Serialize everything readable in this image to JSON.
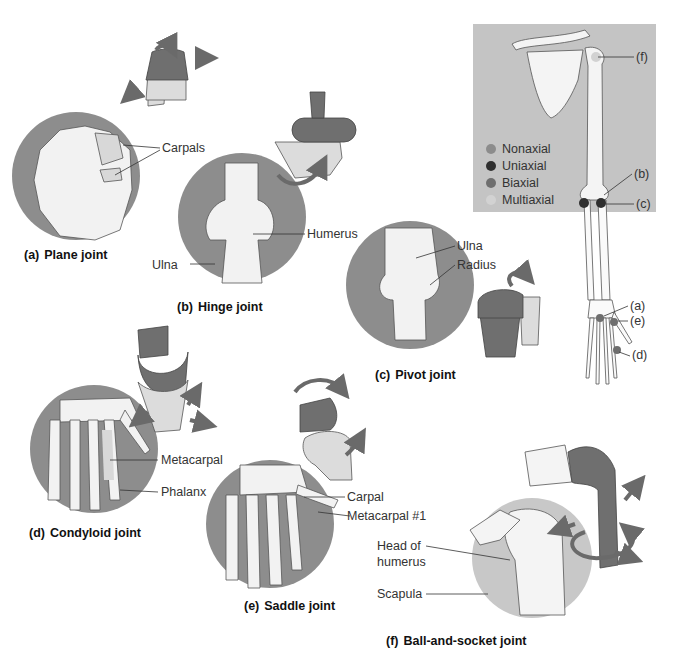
{
  "figure": {
    "panels": [
      {
        "id": "a",
        "prefix": "(a)",
        "title": "Plane joint",
        "labels": [
          "Carpals"
        ]
      },
      {
        "id": "b",
        "prefix": "(b)",
        "title": "Hinge joint",
        "labels": [
          "Humerus",
          "Ulna"
        ]
      },
      {
        "id": "c",
        "prefix": "(c)",
        "title": "Pivot joint",
        "labels": [
          "Ulna",
          "Radius"
        ]
      },
      {
        "id": "d",
        "prefix": "(d)",
        "title": "Condyloid joint",
        "labels": [
          "Metacarpal",
          "Phalanx"
        ]
      },
      {
        "id": "e",
        "prefix": "(e)",
        "title": "Saddle joint",
        "labels": [
          "Carpal",
          "Metacarpal #1"
        ]
      },
      {
        "id": "f",
        "prefix": "(f)",
        "title": "Ball-and-socket joint",
        "labels": [
          "Head of",
          "humerus",
          "Scapula"
        ]
      }
    ],
    "skeleton_inset": {
      "markers": [
        "(f)",
        "(b)",
        "(c)",
        "(a)",
        "(e)",
        "(d)"
      ],
      "legend": [
        {
          "label": "Nonaxial",
          "color": "#8c8c8c"
        },
        {
          "label": "Uniaxial",
          "color": "#2f2f2f"
        },
        {
          "label": "Biaxial",
          "color": "#6e6e6e"
        },
        {
          "label": "Multiaxial",
          "color": "#d2d2d2"
        }
      ],
      "background": "#c4c4c4"
    },
    "colors": {
      "circle_bg": "#8d8d8d",
      "circle_bg_light": "#c8c8c8",
      "bone": "#f2f2f2",
      "model_dark": "#6f6f6f",
      "model_light": "#dcdcdc",
      "arrow": "#6a6a6a"
    }
  }
}
